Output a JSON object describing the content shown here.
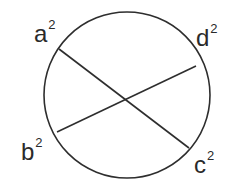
{
  "diagram": {
    "type": "circle-with-chords",
    "circle": {
      "cx": 127,
      "cy": 95,
      "r": 83,
      "stroke": "#2e2e2e"
    },
    "chords": [
      {
        "id": "a-c",
        "x1": 59,
        "y1": 49,
        "x2": 189,
        "y2": 148
      },
      {
        "id": "d-b",
        "x1": 196,
        "y1": 66,
        "x2": 57,
        "y2": 132
      }
    ],
    "labels": {
      "a": {
        "base": "a",
        "exp": "2"
      },
      "b": {
        "base": "b",
        "exp": "2"
      },
      "c": {
        "base": "c",
        "exp": "2"
      },
      "d": {
        "base": "d",
        "exp": "2"
      }
    }
  }
}
